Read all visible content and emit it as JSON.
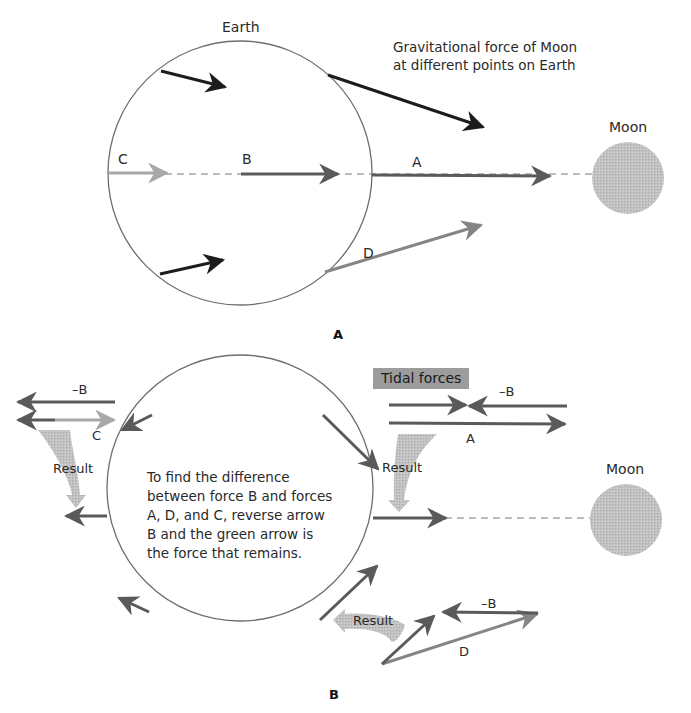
{
  "panel_a": {
    "earth_label": "Earth",
    "moon_label": "Moon",
    "caption_line1": "Gravitational force of Moon",
    "caption_line2": "at different points on Earth",
    "label_a": "A",
    "label_b": "B",
    "label_c": "C",
    "label_d": "D",
    "panel_letter": "A"
  },
  "panel_b": {
    "tidal_forces": "Tidal forces",
    "moon_label": "Moon",
    "neg_b_left": "–B",
    "label_c": "C",
    "result_left": "Result",
    "neg_b_right": "–B",
    "label_a": "A",
    "result_right": "Result",
    "result_bottom": "Result",
    "neg_b_bottom": "–B",
    "label_d": "D",
    "note_lines": [
      "To find the difference",
      "between force B and forces",
      "A, D, and C, reverse arrow",
      "B and the green arrow is",
      "the force that remains."
    ],
    "panel_letter": "B"
  },
  "colors": {
    "circle_stroke": "#6e6e6e",
    "arrow_dark": "#1c1c1c",
    "arrow_mid": "#5a5a5a",
    "arrow_light": "#a8a8a8",
    "moon_fill": "#bdbdbd",
    "result_fill": "#c4c4c4",
    "tidal_bg": "#9c9c9c"
  }
}
